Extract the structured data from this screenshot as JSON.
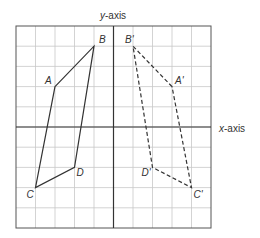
{
  "diagram": {
    "type": "coordinate-grid-reflection",
    "axes": {
      "x_label": "x-axis",
      "y_label": "y-axis",
      "x_range": [
        -5,
        5
      ],
      "y_range": [
        -5,
        5
      ]
    },
    "original": {
      "name": "ABCD",
      "style": "solid",
      "vertices": [
        {
          "label": "A",
          "x": -3,
          "y": 2
        },
        {
          "label": "B",
          "x": -1,
          "y": 4
        },
        {
          "label": "D",
          "x": -2,
          "y": -2
        },
        {
          "label": "C",
          "x": -4,
          "y": -3
        }
      ]
    },
    "image": {
      "name": "A'B'C'D'",
      "style": "dashed",
      "vertices": [
        {
          "label": "A'",
          "x": 3,
          "y": 2
        },
        {
          "label": "B'",
          "x": 1,
          "y": 4
        },
        {
          "label": "D'",
          "x": 2,
          "y": -2
        },
        {
          "label": "C'",
          "x": 4,
          "y": -3
        }
      ]
    },
    "colors": {
      "grid": "#c8c8c8",
      "axis": "#333333",
      "shape": "#333333"
    }
  }
}
